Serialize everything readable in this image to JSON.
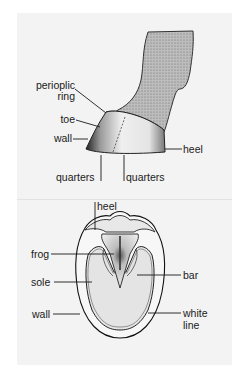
{
  "diagram": {
    "side_view": {
      "labels": {
        "periople_line1": "perioplic",
        "periople_line2": "ring",
        "toe": "toe",
        "wall": "wall",
        "heel": "heel",
        "quarters_left": "quarters",
        "quarters_right": "quarters"
      }
    },
    "bottom_view": {
      "labels": {
        "heel": "heel",
        "frog": "frog",
        "sole": "sole",
        "wall": "wall",
        "bar": "bar",
        "white_line_1": "white",
        "white_line_2": "line"
      }
    },
    "colors": {
      "panel": "#f3f3f3",
      "background": "#ffffff",
      "ink": "#1a1a1a",
      "leg_fill": "#c8c8c8",
      "hoof_fill": "#ececec"
    }
  }
}
